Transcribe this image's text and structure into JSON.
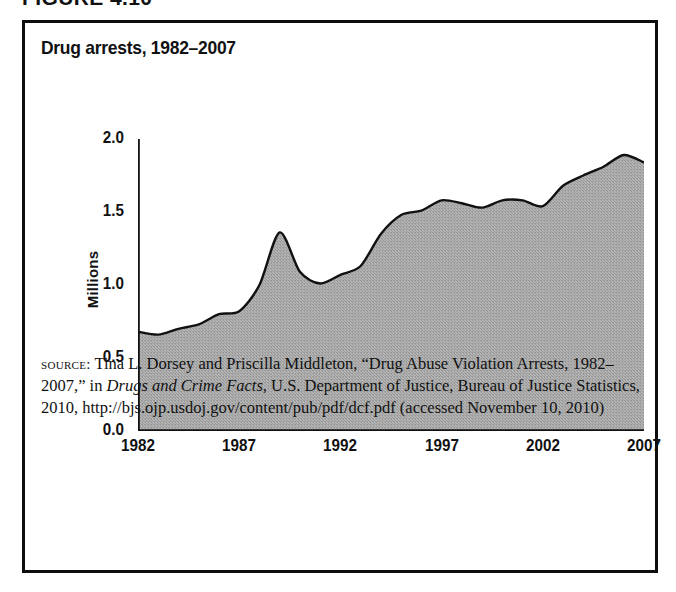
{
  "figure_head": "FIGURE 4.10",
  "figure": {
    "title": "Drug arrests, 1982–2007"
  },
  "source_note": {
    "label": "source:",
    "text_before_italic": " Tina L. Dorsey and Priscilla Middleton, “Drug Abuse Violation Arrests, 1982–2007,” in ",
    "italic_title": "Drugs and Crime Facts",
    "text_after_italic": ", U.S. Department of Justice, Bureau of Justice Statistics, 2010, http://bjs.ojp.usdoj.gov/content/pub/pdf/dcf.pdf (accessed November 10, 2010)"
  },
  "colors": {
    "fill": "#aaaaaa",
    "line": "#111111",
    "axis": "#111111",
    "background": "#ffffff",
    "border": "#0d0d0d"
  },
  "chart_data": {
    "type": "area",
    "title": "Drug arrests, 1982–2007",
    "xlabel": "",
    "ylabel": "Millions",
    "xlim": [
      1982,
      2007
    ],
    "ylim": [
      0.0,
      2.0
    ],
    "yticks": [
      "0.0",
      "0.5",
      "1.0",
      "1.5",
      "2.0"
    ],
    "ytick_values": [
      0.0,
      0.5,
      1.0,
      1.5,
      2.0
    ],
    "xticks": [
      "1982",
      "1987",
      "1992",
      "1997",
      "2002",
      "2007"
    ],
    "xtick_values": [
      1982,
      1987,
      1992,
      1997,
      2002,
      2007
    ],
    "grid": false,
    "legend": false,
    "x": [
      1982,
      1983,
      1984,
      1985,
      1986,
      1987,
      1988,
      1989,
      1990,
      1991,
      1992,
      1993,
      1994,
      1995,
      1996,
      1997,
      1998,
      1999,
      2000,
      2001,
      2002,
      2003,
      2004,
      2005,
      2006,
      2007
    ],
    "values": [
      0.68,
      0.66,
      0.7,
      0.73,
      0.8,
      0.82,
      1.0,
      1.36,
      1.09,
      1.01,
      1.07,
      1.13,
      1.35,
      1.48,
      1.51,
      1.58,
      1.56,
      1.53,
      1.58,
      1.58,
      1.54,
      1.68,
      1.75,
      1.81,
      1.89,
      1.84
    ],
    "series": [
      {
        "name": "Drug arrests",
        "values": [
          0.68,
          0.66,
          0.7,
          0.73,
          0.8,
          0.82,
          1.0,
          1.36,
          1.09,
          1.01,
          1.07,
          1.13,
          1.35,
          1.48,
          1.51,
          1.58,
          1.56,
          1.53,
          1.58,
          1.58,
          1.54,
          1.68,
          1.75,
          1.81,
          1.89,
          1.84
        ]
      }
    ]
  }
}
